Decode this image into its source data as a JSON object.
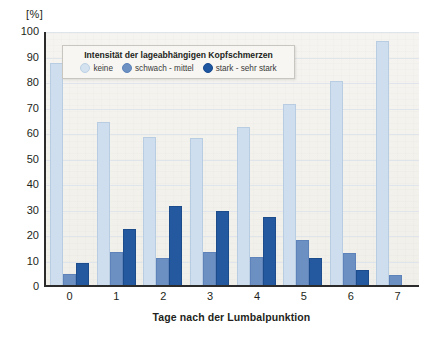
{
  "chart_data": {
    "type": "bar",
    "title": "",
    "xlabel": "Tage nach der Lumbalpunktion",
    "ylabel": "",
    "yunit": "[%]",
    "ylim": [
      0,
      100
    ],
    "yticks": [
      100,
      90,
      80,
      70,
      60,
      50,
      40,
      30,
      20,
      10,
      0
    ],
    "grid": true,
    "categories": [
      "0",
      "1",
      "2",
      "3",
      "4",
      "5",
      "6",
      "7"
    ],
    "legend": {
      "position": "inside-top-left",
      "title": "Intensität der lageabhängigen Kopfschmerzen",
      "entries": [
        {
          "label": "keine",
          "color": "#cfdeee"
        },
        {
          "label": "schwach - mittel",
          "color": "#6d90c3"
        },
        {
          "label": "stark - sehr stark",
          "color": "#24599f"
        }
      ]
    },
    "series": [
      {
        "name": "keine",
        "color": "#cfdeee",
        "values": [
          87,
          64,
          58,
          57.5,
          62,
          71,
          80,
          95.5
        ]
      },
      {
        "name": "schwach - mittel",
        "color": "#6d90c3",
        "values": [
          4.5,
          13,
          10.5,
          13,
          11,
          17.5,
          12.5,
          4
        ]
      },
      {
        "name": "stark - sehr stark",
        "color": "#24599f",
        "values": [
          8.5,
          22,
          31,
          29,
          26.5,
          10.5,
          6,
          0
        ]
      }
    ]
  }
}
